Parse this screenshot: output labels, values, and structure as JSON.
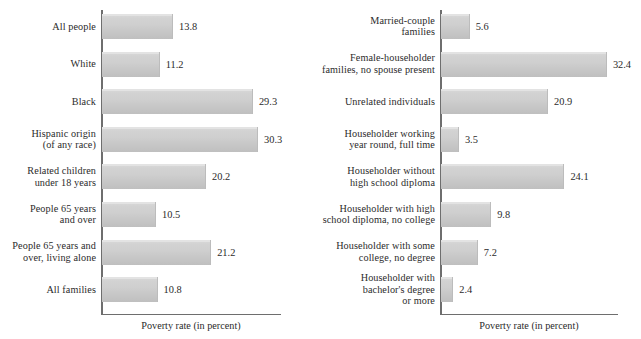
{
  "chart_data": [
    {
      "type": "bar",
      "orientation": "horizontal",
      "title": "",
      "xlabel": "Poverty rate (in percent)",
      "ylabel": "",
      "xlim": [
        0,
        35
      ],
      "grid": false,
      "legend": "none",
      "panel": "left",
      "categories": [
        "All people",
        "White",
        "Black",
        "Hispanic origin\n(of any race)",
        "Related children\nunder 18 years",
        "People 65 years\nand over",
        "People 65 years and\nover, living alone",
        "All families"
      ],
      "values": [
        13.8,
        11.2,
        29.3,
        30.3,
        20.2,
        10.5,
        21.2,
        10.8
      ],
      "value_labels": [
        "13.8",
        "11.2",
        "29.3",
        "30.3",
        "20.2",
        "10.5",
        "21.2",
        "10.8"
      ]
    },
    {
      "type": "bar",
      "orientation": "horizontal",
      "title": "",
      "xlabel": "Poverty rate (in percent)",
      "ylabel": "",
      "xlim": [
        0,
        35
      ],
      "grid": false,
      "legend": "none",
      "panel": "right",
      "categories": [
        "Married-couple\nfamilies",
        "Female-householder\nfamilies, no spouse present",
        "Unrelated individuals",
        "Householder working\nyear round, full time",
        "Householder without\nhigh school diploma",
        "Householder with high\nschool diploma, no college",
        "Householder with some\ncollege, no degree",
        "Householder with\nbachelor's degree\nor more"
      ],
      "values": [
        5.6,
        32.4,
        20.9,
        3.5,
        24.1,
        9.8,
        7.2,
        2.4
      ],
      "value_labels": [
        "5.6",
        "32.4",
        "20.9",
        "3.5",
        "24.1",
        "9.8",
        "7.2",
        "2.4"
      ]
    }
  ],
  "colors": {
    "bar_light": "#d9d9d9",
    "bar_dark": "#bfbfbf",
    "axis": "#6e6e6e",
    "text": "#2b2b2b",
    "background": "#ffffff"
  },
  "left_chart": {
    "axis_title": "Poverty rate (in percent)",
    "rows": [
      {
        "label_line1": "All people",
        "label_line2": "",
        "label_line3": "",
        "value": "13.8"
      },
      {
        "label_line1": "White",
        "label_line2": "",
        "label_line3": "",
        "value": "11.2"
      },
      {
        "label_line1": "Black",
        "label_line2": "",
        "label_line3": "",
        "value": "29.3"
      },
      {
        "label_line1": "Hispanic origin",
        "label_line2": "(of any race)",
        "label_line3": "",
        "value": "30.3"
      },
      {
        "label_line1": "Related children",
        "label_line2": "under 18 years",
        "label_line3": "",
        "value": "20.2"
      },
      {
        "label_line1": "People 65 years",
        "label_line2": "and over",
        "label_line3": "",
        "value": "10.5"
      },
      {
        "label_line1": "People 65 years and",
        "label_line2": "over, living alone",
        "label_line3": "",
        "value": "21.2"
      },
      {
        "label_line1": "All families",
        "label_line2": "",
        "label_line3": "",
        "value": "10.8"
      }
    ]
  },
  "right_chart": {
    "axis_title": "Poverty rate (in percent)",
    "rows": [
      {
        "label_line1": "Married-couple",
        "label_line2": "families",
        "label_line3": "",
        "value": "5.6"
      },
      {
        "label_line1": "Female-householder",
        "label_line2": "families, no spouse present",
        "label_line3": "",
        "value": "32.4"
      },
      {
        "label_line1": "Unrelated individuals",
        "label_line2": "",
        "label_line3": "",
        "value": "20.9"
      },
      {
        "label_line1": "Householder working",
        "label_line2": "year round, full time",
        "label_line3": "",
        "value": "3.5"
      },
      {
        "label_line1": "Householder without",
        "label_line2": "high school diploma",
        "label_line3": "",
        "value": "24.1"
      },
      {
        "label_line1": "Householder with high",
        "label_line2": "school diploma, no college",
        "label_line3": "",
        "value": "9.8"
      },
      {
        "label_line1": "Householder with some",
        "label_line2": "college, no degree",
        "label_line3": "",
        "value": "7.2"
      },
      {
        "label_line1": "Householder with",
        "label_line2": "bachelor's degree",
        "label_line3": "or more",
        "value": "2.4"
      }
    ]
  }
}
